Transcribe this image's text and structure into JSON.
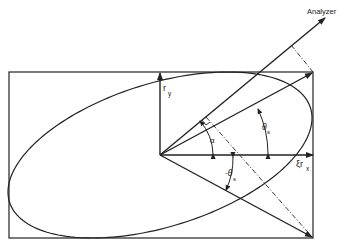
{
  "diagram": {
    "type": "polarization-ellipse",
    "colors": {
      "stroke": "#222222",
      "background": "#ffffff"
    },
    "labels": {
      "analyzer": "Analyzer",
      "ry_main": "r",
      "ry_sub": "y",
      "rx_prefix": "ξrx",
      "rx_main": "ξr",
      "rx_sub": "x",
      "alpha": "α",
      "theta_s_main": "θ",
      "theta_s_sub": "s",
      "neg_theta_s_main": "-θ",
      "neg_theta_s_sub": "s"
    },
    "elements": [
      "bounding-rectangle",
      "tilted-ellipse",
      "y-axis-arrow",
      "x-axis-arrow",
      "analyzer-axis-arrow",
      "theta-s-arrow",
      "neg-theta-s-arrow",
      "projection-dash-dot-lines",
      "angle-arcs"
    ]
  }
}
